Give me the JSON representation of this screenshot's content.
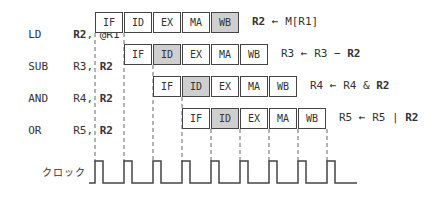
{
  "diagram": {
    "type": "pipeline-timing",
    "stages": [
      "IF",
      "ID",
      "EX",
      "MA",
      "WB"
    ],
    "rows": [
      {
        "opcode": "LD",
        "operands_plain": "",
        "dest": "R2",
        "sep": ", ",
        "src": "@R1",
        "src_bold": false,
        "start_cycle": 0,
        "highlight_stage": "WB",
        "note": {
          "lhs": "R2",
          "arrow": " ← ",
          "rhs": "M[R1]",
          "op": "",
          "rhs2": ""
        }
      },
      {
        "opcode": "SUB",
        "dest": "R3",
        "sep": ", ",
        "src": "R2",
        "src_bold": true,
        "start_cycle": 1,
        "highlight_stage": "ID",
        "note": {
          "lhs": "R3",
          "arrow": " ← ",
          "rhs": "R3",
          "op": " − ",
          "rhs2": "R2"
        }
      },
      {
        "opcode": "AND",
        "dest": "R4",
        "sep": ", ",
        "src": "R2",
        "src_bold": true,
        "start_cycle": 2,
        "highlight_stage": "ID",
        "note": {
          "lhs": "R4",
          "arrow": " ← ",
          "rhs": "R4",
          "op": " & ",
          "rhs2": "R2"
        }
      },
      {
        "opcode": "OR",
        "dest": "R5",
        "sep": ", ",
        "src": "R2",
        "src_bold": true,
        "start_cycle": 3,
        "highlight_stage": "ID",
        "note": {
          "lhs": "R5",
          "arrow": " ← ",
          "rhs": "R5",
          "op": " | ",
          "rhs2": "R2"
        }
      }
    ],
    "clock_label": "クロック",
    "clock_pulses": 9,
    "colors": {
      "line": "#444444",
      "highlight": "#cfcfcf",
      "dashed": "#666666"
    }
  }
}
